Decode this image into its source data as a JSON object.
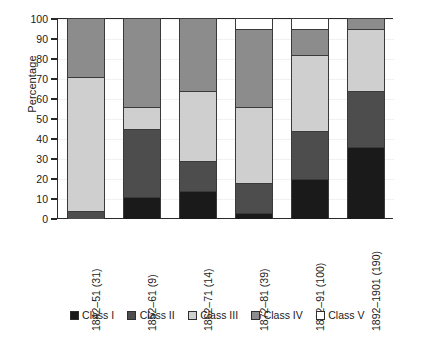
{
  "chart_data": {
    "type": "bar",
    "subtype": "stacked-bar-100-percent",
    "title": "",
    "xlabel": "",
    "ylabel": "Percentage",
    "ylim": [
      0,
      100
    ],
    "yticks": [
      0,
      10,
      20,
      30,
      40,
      50,
      60,
      70,
      80,
      90,
      100
    ],
    "ytick_labels": [
      "0",
      "10",
      "20",
      "30",
      "40",
      "50",
      "60",
      "70",
      "80",
      "90",
      "100"
    ],
    "grid": true,
    "legend_position": "bottom",
    "categories": [
      "1842–51 (31)",
      "1852–61 (9)",
      "1862–71 (14)",
      "1872–81 (39)",
      "1882–91 (100)",
      "1892–1901 (190)"
    ],
    "category_counts": [
      31,
      9,
      14,
      39,
      100,
      190
    ],
    "series": [
      {
        "name": "Class I",
        "color": "#1a1a1a",
        "values": [
          0,
          11,
          14,
          3,
          20,
          36
        ]
      },
      {
        "name": "Class II",
        "color": "#4d4d4d",
        "values": [
          4,
          34,
          15,
          15,
          24,
          28
        ]
      },
      {
        "name": "Class III",
        "color": "#cfcfcf",
        "values": [
          67,
          11,
          35,
          38,
          38,
          31
        ]
      },
      {
        "name": "Class IV",
        "color": "#8c8c8c",
        "values": [
          29,
          44,
          36,
          39,
          13,
          5
        ]
      },
      {
        "name": "Class V",
        "color": "#ffffff",
        "values": [
          0,
          0,
          0,
          5,
          5,
          0
        ]
      }
    ],
    "cumulative_tops": {
      "1842–51 (31)": {
        "Class I": 0,
        "Class II": 4,
        "Class III": 71,
        "Class IV": 100,
        "Class V": 100
      },
      "1852–61 (9)": {
        "Class I": 11,
        "Class II": 45,
        "Class III": 56,
        "Class IV": 100,
        "Class V": 100
      },
      "1862–71 (14)": {
        "Class I": 14,
        "Class II": 29,
        "Class III": 64,
        "Class IV": 100,
        "Class V": 100
      },
      "1872–81 (39)": {
        "Class I": 3,
        "Class II": 18,
        "Class III": 56,
        "Class IV": 95,
        "Class V": 100
      },
      "1882–91 (100)": {
        "Class I": 20,
        "Class II": 44,
        "Class III": 82,
        "Class IV": 95,
        "Class V": 100
      },
      "1892–1901 (190)": {
        "Class I": 36,
        "Class II": 64,
        "Class III": 95,
        "Class IV": 100,
        "Class V": 100
      }
    }
  },
  "axes": {
    "y_title": "Percentage"
  },
  "legend": {
    "items": [
      {
        "label": "Class I",
        "color": "#1a1a1a"
      },
      {
        "label": "Class II",
        "color": "#4d4d4d"
      },
      {
        "label": "Class III",
        "color": "#cfcfcf"
      },
      {
        "label": "Class IV",
        "color": "#8c8c8c"
      },
      {
        "label": "Class V",
        "color": "#ffffff"
      }
    ]
  }
}
